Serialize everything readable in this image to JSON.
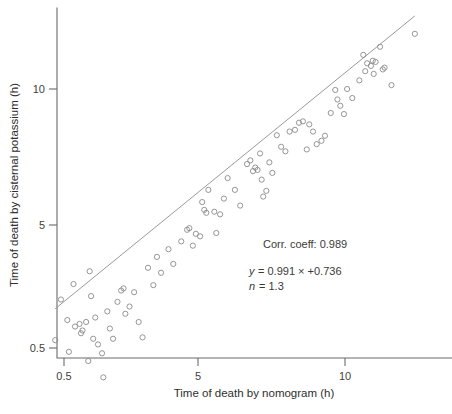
{
  "chart_data": {
    "type": "scatter",
    "title": "",
    "xlabel": "Time of death by nomogram (h)",
    "ylabel": "Time of death by cisternal potassium (h)",
    "xscale": "log",
    "yscale": "log",
    "xticks": [
      0.5,
      5,
      10
    ],
    "xtick_labels": [
      "0.5",
      "5",
      "10"
    ],
    "yticks": [
      0.5,
      5,
      10
    ],
    "ytick_labels": [
      "0.5",
      "5",
      "10"
    ],
    "xlim": [
      0.5,
      14.5
    ],
    "ylim": [
      0.5,
      14.0
    ],
    "grid": false,
    "legend": null,
    "marker": "open-circle",
    "annotations": [
      "Corr. coeff: 0.989",
      "y = 0.991 × +0.736",
      "n = 1.3"
    ],
    "annotation_lines": {
      "corr_coeff_label": "Corr. coeff: 0.989",
      "equation_var": "y",
      "equation_body": "= 0.991 × +0.736",
      "n_var": "n",
      "n_body": "= 1.3"
    },
    "fit_line": {
      "label": "regression line",
      "slope": 0.991,
      "intercept": 0.736,
      "x_start": 2.55,
      "x_end": 13.9
    },
    "points": [
      [
        2.55,
        2.78
      ],
      [
        2.62,
        3.42
      ],
      [
        2.7,
        3.08
      ],
      [
        2.72,
        2.62
      ],
      [
        2.78,
        3.7
      ],
      [
        2.8,
        2.98
      ],
      [
        2.86,
        3.02
      ],
      [
        2.88,
        2.88
      ],
      [
        2.9,
        2.92
      ],
      [
        2.95,
        3.05
      ],
      [
        2.98,
        2.5
      ],
      [
        3.0,
        3.95
      ],
      [
        3.02,
        3.48
      ],
      [
        3.05,
        2.8
      ],
      [
        3.08,
        3.12
      ],
      [
        3.12,
        2.72
      ],
      [
        3.18,
        2.6
      ],
      [
        3.2,
        2.3
      ],
      [
        3.26,
        3.22
      ],
      [
        3.3,
        2.95
      ],
      [
        3.35,
        2.8
      ],
      [
        3.42,
        3.38
      ],
      [
        3.48,
        3.58
      ],
      [
        3.52,
        3.62
      ],
      [
        3.55,
        3.18
      ],
      [
        3.62,
        3.3
      ],
      [
        3.7,
        3.55
      ],
      [
        3.78,
        3.05
      ],
      [
        3.85,
        2.82
      ],
      [
        3.95,
        4.02
      ],
      [
        4.05,
        3.68
      ],
      [
        4.12,
        4.25
      ],
      [
        4.2,
        3.92
      ],
      [
        4.35,
        4.42
      ],
      [
        4.45,
        4.1
      ],
      [
        4.62,
        4.6
      ],
      [
        4.75,
        4.88
      ],
      [
        4.8,
        4.92
      ],
      [
        4.88,
        4.5
      ],
      [
        4.95,
        4.78
      ],
      [
        5.05,
        4.72
      ],
      [
        5.1,
        5.62
      ],
      [
        5.15,
        5.4
      ],
      [
        5.2,
        5.32
      ],
      [
        5.25,
        5.98
      ],
      [
        5.4,
        5.35
      ],
      [
        5.45,
        4.8
      ],
      [
        5.55,
        5.28
      ],
      [
        5.65,
        5.72
      ],
      [
        5.75,
        6.35
      ],
      [
        5.95,
        5.98
      ],
      [
        6.1,
        5.52
      ],
      [
        6.3,
        6.82
      ],
      [
        6.4,
        6.95
      ],
      [
        6.48,
        6.58
      ],
      [
        6.55,
        6.7
      ],
      [
        6.62,
        6.62
      ],
      [
        6.7,
        7.2
      ],
      [
        6.75,
        6.3
      ],
      [
        6.8,
        5.78
      ],
      [
        6.9,
        5.95
      ],
      [
        7.0,
        6.88
      ],
      [
        7.1,
        6.52
      ],
      [
        7.25,
        7.9
      ],
      [
        7.4,
        7.45
      ],
      [
        7.55,
        7.28
      ],
      [
        7.7,
        8.05
      ],
      [
        7.9,
        8.12
      ],
      [
        8.05,
        8.42
      ],
      [
        8.2,
        8.48
      ],
      [
        8.35,
        7.35
      ],
      [
        8.45,
        8.35
      ],
      [
        8.6,
        8.05
      ],
      [
        8.75,
        7.55
      ],
      [
        8.95,
        7.68
      ],
      [
        9.1,
        7.88
      ],
      [
        9.35,
        8.85
      ],
      [
        9.55,
        9.95
      ],
      [
        9.65,
        9.48
      ],
      [
        9.78,
        9.18
      ],
      [
        9.95,
        8.8
      ],
      [
        10.1,
        10.0
      ],
      [
        10.35,
        9.55
      ],
      [
        10.7,
        10.45
      ],
      [
        10.9,
        11.9
      ],
      [
        11.0,
        10.95
      ],
      [
        11.1,
        11.4
      ],
      [
        11.3,
        11.25
      ],
      [
        11.4,
        11.55
      ],
      [
        11.45,
        10.8
      ],
      [
        11.55,
        11.48
      ],
      [
        11.8,
        12.4
      ],
      [
        11.95,
        11.05
      ],
      [
        12.05,
        11.15
      ],
      [
        12.45,
        10.2
      ],
      [
        13.9,
        13.25
      ]
    ]
  }
}
